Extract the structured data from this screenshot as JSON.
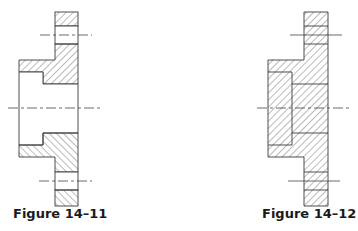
{
  "figures": [
    {
      "caption": "Figure 14–11",
      "description": "Flange half-section, bore and bolt holes unhatched",
      "hatch_direction": "right-leaning top / left-leaning bottom"
    },
    {
      "caption": "Figure 14–12",
      "description": "Flange section fully hatched including bore and bolt holes",
      "hatch_direction": "uniform right-leaning"
    }
  ],
  "colors": {
    "line": "#3a3a3a",
    "hatch": "#555555",
    "centerline": "#444444",
    "background": "#ffffff"
  }
}
